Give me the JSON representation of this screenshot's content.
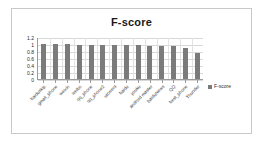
{
  "chart_data": {
    "type": "bar",
    "title": "F-score",
    "xlabel": "",
    "ylabel": "",
    "ylim": [
      0,
      1.2
    ],
    "yticks": [
      "1.2",
      "1",
      "0.8",
      "0.6",
      "0.4",
      "0.2",
      "0"
    ],
    "ytick_values": [
      1.2,
      1.0,
      0.8,
      0.6,
      0.4,
      0.2,
      0
    ],
    "grid": true,
    "legend_position": "right",
    "legend": [
      "F-score"
    ],
    "series_color": "#7b7b7b",
    "categories": [
      "baiduskip",
      "gmail_phone",
      "weixin",
      "weibo",
      "qq_phone",
      "qq_phone2",
      "utorrent",
      "baidu",
      "youku",
      "android master",
      "baiduNews",
      "QQ",
      "best_phone",
      "Thunder"
    ],
    "series": [
      {
        "name": "F-score",
        "values": [
          1.0,
          1.0,
          1.0,
          0.98,
          0.98,
          0.98,
          0.98,
          0.97,
          0.97,
          0.95,
          0.94,
          0.94,
          0.88,
          0.75
        ]
      }
    ]
  },
  "legend": {
    "swatch_icon": "legend-square-icon",
    "label": "F-score"
  }
}
